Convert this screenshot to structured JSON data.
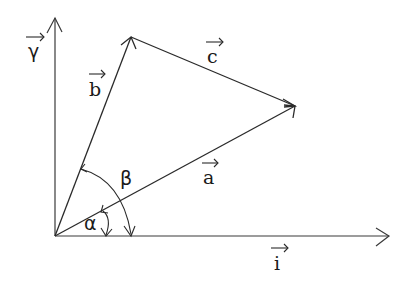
{
  "diagram": {
    "title": "",
    "axes": {
      "x_label": "i",
      "y_label": "γ"
    },
    "vectors": [
      {
        "id": "a",
        "label": "a",
        "from": "origin",
        "to": "P"
      },
      {
        "id": "b",
        "label": "b",
        "from": "origin",
        "to": "Q"
      },
      {
        "id": "c",
        "label": "c",
        "from": "Q",
        "to": "P"
      }
    ],
    "angles": [
      {
        "id": "alpha",
        "label": "α",
        "between": [
          "i",
          "a"
        ]
      },
      {
        "id": "beta",
        "label": "β",
        "between": [
          "i",
          "b"
        ]
      }
    ],
    "colors": {
      "stroke": "#2a2a2a",
      "background": "#ffffff"
    }
  }
}
